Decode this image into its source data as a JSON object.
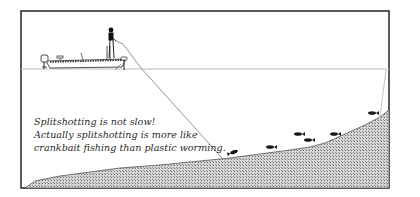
{
  "diagram": {
    "caption_lines": [
      "Splitshotting is not slow!",
      "Actually splitshotting is more like",
      "crankbait fishing than plastic worming."
    ],
    "elements": {
      "boat": "bass-boat-icon",
      "angler": "angler-icon",
      "line": "fishing-line",
      "bottom": "lake-bottom-hatched",
      "fish": [
        "fish-icon",
        "fish-icon",
        "fish-icon",
        "fish-icon",
        "fish-icon",
        "fish-icon"
      ]
    },
    "colors": {
      "frame": "#333333",
      "water_line": "#bbbbbb",
      "line": "#888888",
      "bottom_fill": "#b8b8b8",
      "fish": "#1a1a1a"
    }
  }
}
